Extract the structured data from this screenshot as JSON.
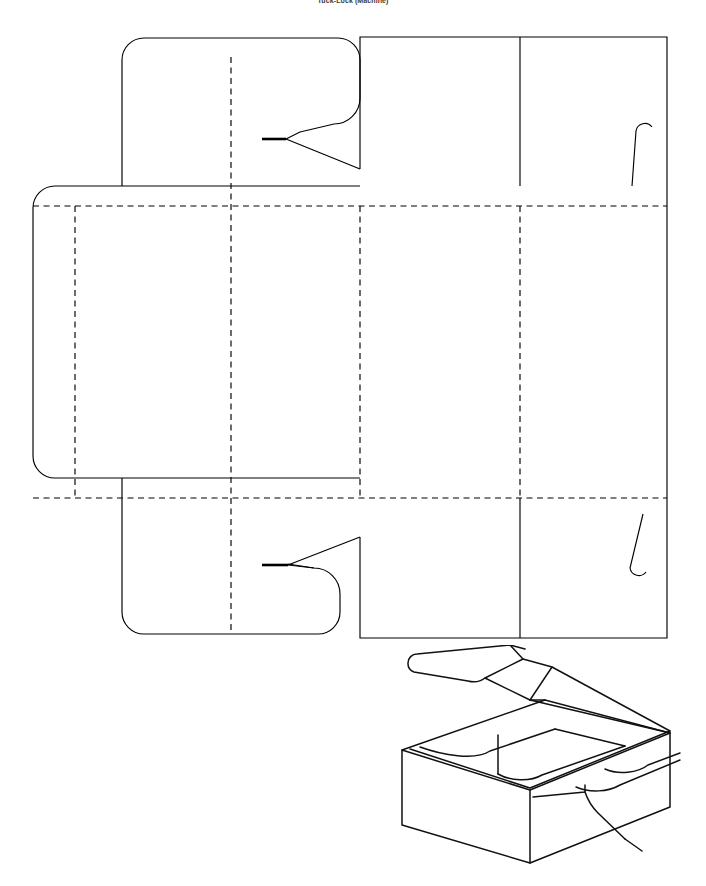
{
  "document": {
    "title": "Tuck-Lock (Machine)",
    "domain_kind": "technical-drawing",
    "background_color": "#ffffff",
    "line_color": "#000000",
    "page_width": 706,
    "page_height": 886
  },
  "drawing": {
    "name": "box-dieline-and-perspective",
    "description": "Packaging die-line flat layout with accompanying 3D open-box perspective view",
    "views": [
      {
        "id": "dieline",
        "label": "Flat die-line layout"
      },
      {
        "id": "perspective",
        "label": "Assembled open box perspective"
      }
    ],
    "line_legend": [
      {
        "style": "solid",
        "meaning": "cut line",
        "color": "#000000"
      },
      {
        "style": "dashed",
        "meaning": "fold / score line",
        "color": "#000000"
      }
    ]
  },
  "dieline": {
    "name": "flat-dieline",
    "bounds": {
      "x": 33,
      "y": 17,
      "width": 634,
      "height": 601
    },
    "panels": [
      {
        "id": "top-tuck-flap",
        "label": "Top tuck flap",
        "x": 122,
        "y": 17,
        "width": 238,
        "height": 149
      },
      {
        "id": "left-glue-flap",
        "label": "Left glue flap",
        "x": 33,
        "y": 166,
        "width": 89,
        "height": 292
      },
      {
        "id": "left-side-panel",
        "label": "Left side panel",
        "x": 122,
        "y": 166,
        "width": 109,
        "height": 292
      },
      {
        "id": "base-panel",
        "label": "Base panel",
        "x": 231,
        "y": 166,
        "width": 129,
        "height": 292
      },
      {
        "id": "front-panel",
        "label": "Front panel",
        "x": 360,
        "y": 166,
        "width": 160,
        "height": 292
      },
      {
        "id": "lid-panel",
        "label": "Lid panel",
        "x": 520,
        "y": 166,
        "width": 147,
        "height": 292
      },
      {
        "id": "top-wall-panel",
        "label": "Top wall panel",
        "x": 360,
        "y": 17,
        "width": 160,
        "height": 149
      },
      {
        "id": "top-right-panel",
        "label": "Top right panel",
        "x": 520,
        "y": 17,
        "width": 147,
        "height": 149
      },
      {
        "id": "bottom-tuck-flap",
        "label": "Bottom tuck flap",
        "x": 122,
        "y": 458,
        "width": 238,
        "height": 160
      },
      {
        "id": "bottom-wall-panel",
        "label": "Bottom wall panel",
        "x": 360,
        "y": 458,
        "width": 160,
        "height": 160
      },
      {
        "id": "bottom-right-panel",
        "label": "Bottom right panel",
        "x": 520,
        "y": 458,
        "width": 147,
        "height": 160
      }
    ],
    "fold_lines": [
      {
        "id": "fold-horizontal-upper",
        "orientation": "horizontal",
        "y": 186,
        "x1": 33,
        "x2": 667
      },
      {
        "id": "fold-horizontal-lower",
        "orientation": "horizontal",
        "y": 478,
        "x1": 33,
        "x2": 667
      },
      {
        "id": "fold-vertical-glue",
        "orientation": "vertical",
        "x": 75,
        "y1": 186,
        "y2": 478
      },
      {
        "id": "fold-vertical-left",
        "orientation": "vertical",
        "x": 231,
        "y1": 37,
        "y2": 612
      },
      {
        "id": "fold-vertical-front",
        "orientation": "vertical",
        "x": 360,
        "y1": 186,
        "y2": 478
      },
      {
        "id": "fold-vertical-lid",
        "orientation": "vertical",
        "x": 520,
        "y1": 186,
        "y2": 478
      }
    ],
    "cut_details": [
      {
        "id": "top-lock-tab",
        "label": "Top lock tab notch",
        "shape": "arrow-notch"
      },
      {
        "id": "bottom-lock-tab",
        "label": "Bottom lock tab notch",
        "shape": "arrow-notch"
      },
      {
        "id": "top-right-hook-slit",
        "label": "Top right hook slit",
        "shape": "hook-slit"
      },
      {
        "id": "bottom-right-hook-slit",
        "label": "Bottom right hook slit",
        "shape": "hook-slit"
      }
    ]
  },
  "perspective": {
    "name": "assembled-box-view",
    "label": "Assembled open box with raised lid",
    "bounds": {
      "x": 380,
      "y": 645,
      "width": 310,
      "height": 230
    },
    "features": [
      {
        "id": "lid",
        "label": "Raised lid flap"
      },
      {
        "id": "box-body",
        "label": "Box body"
      },
      {
        "id": "front-face",
        "label": "Front face"
      },
      {
        "id": "right-face",
        "label": "Right face"
      },
      {
        "id": "top-opening",
        "label": "Open top with inner flaps"
      },
      {
        "id": "side-hook-tab",
        "label": "Side hook tab"
      }
    ]
  }
}
